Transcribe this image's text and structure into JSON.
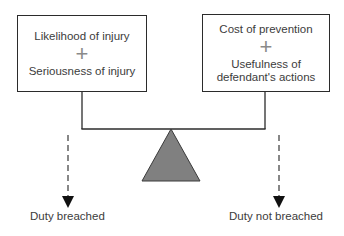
{
  "diagram": {
    "type": "balance-scale",
    "left_factors": {
      "line1": "Likelihood of injury",
      "operator": "+",
      "line2": "Seriousness of injury"
    },
    "right_factors": {
      "line1": "Cost of prevention",
      "operator": "+",
      "line2a": "Usefulness of",
      "line2b": "defendant's actions"
    },
    "outcomes": {
      "left": "Duty breached",
      "right": "Duty not breached"
    },
    "colors": {
      "fulcrum_fill": "#808080",
      "lines": "#2b2b2b",
      "plus_sign": "#8a8a8a",
      "dashed_arrow": "#555555",
      "arrowhead": "#111111"
    }
  }
}
